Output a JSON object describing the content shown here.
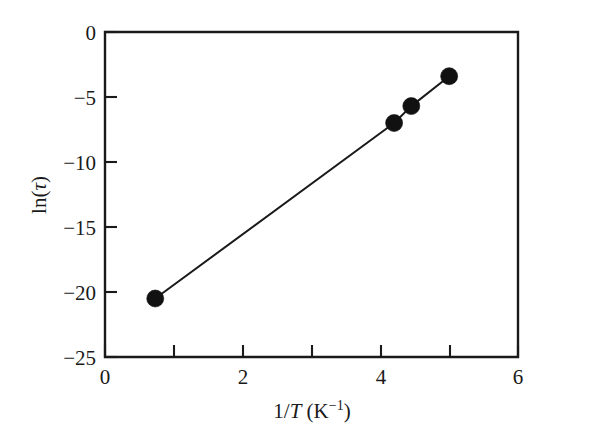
{
  "chart_data": {
    "type": "line",
    "title": "",
    "subtitle": "",
    "xlabel": "1/T (K⁻¹)",
    "ylabel": "ln(τ)",
    "xlim": [
      0,
      6
    ],
    "ylim": [
      -25,
      0
    ],
    "grid": false,
    "legend": null,
    "x_major_ticks": [
      0,
      2,
      4,
      6
    ],
    "x_minor_ticks": [
      1,
      3,
      5
    ],
    "y_major_ticks": [
      0,
      -5,
      -10,
      -15,
      -20,
      -25
    ],
    "x_tick_labels": [
      "0",
      "2",
      "4",
      "6"
    ],
    "y_tick_labels": [
      "0",
      "−5",
      "−10",
      "−15",
      "−20",
      "−25"
    ],
    "series": [
      {
        "name": "ln(tau) vs 1/T",
        "marker": "filled-circle",
        "marker_color": "#111111",
        "line_color": "#1a1a1a",
        "x": [
          0.73,
          4.2,
          4.45,
          5.0
        ],
        "y": [
          -20.5,
          -7.0,
          -5.7,
          -3.4
        ],
        "points": [
          {
            "x": 0.73,
            "y": -20.5
          },
          {
            "x": 4.2,
            "y": -7.0
          },
          {
            "x": 4.45,
            "y": -5.7
          },
          {
            "x": 5.0,
            "y": -3.4
          }
        ]
      }
    ]
  },
  "axis_labels": {
    "x_title_prefix": "1/",
    "x_title_var": "T",
    "x_title_unit_open": " (K",
    "x_title_unit_exp": "−1",
    "x_title_unit_close": ")",
    "y_title_fn": "ln(",
    "y_title_var": "τ",
    "y_title_close": ")"
  }
}
